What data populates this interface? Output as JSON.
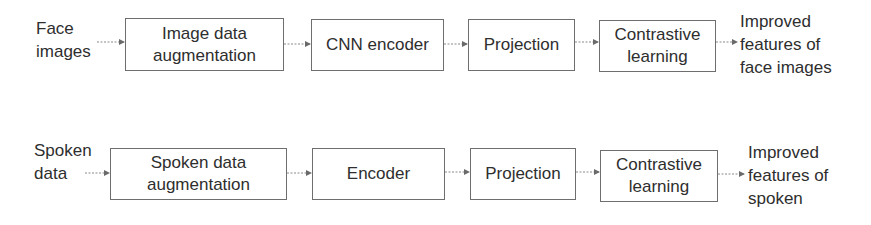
{
  "rows": [
    {
      "input_label": [
        "Face",
        "images"
      ],
      "steps": [
        {
          "label": [
            "Image data",
            "augmentation"
          ]
        },
        {
          "label": [
            "CNN encoder"
          ]
        },
        {
          "label": [
            "Projection"
          ]
        },
        {
          "label": [
            "Contrastive",
            "learning"
          ]
        }
      ],
      "output_label": [
        "Improved",
        "features of",
        "face images"
      ]
    },
    {
      "input_label": [
        "Spoken",
        "data"
      ],
      "steps": [
        {
          "label": [
            "Spoken data",
            "augmentation"
          ]
        },
        {
          "label": [
            "Encoder"
          ]
        },
        {
          "label": [
            "Projection"
          ]
        },
        {
          "label": [
            "Contrastive",
            "learning"
          ]
        }
      ],
      "output_label": [
        "Improved",
        "features of",
        "spoken"
      ]
    }
  ],
  "colors": {
    "text": "#2e2e2e",
    "box_border": "#6e6e6e",
    "arrow": "#7a7a7a",
    "background": "#ffffff"
  }
}
